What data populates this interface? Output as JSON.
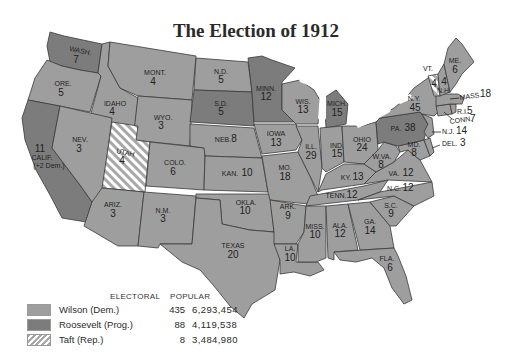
{
  "title": "The Election of 1912",
  "colors": {
    "wilson": "#9e9e9e",
    "roosevelt": "#7c7c7c",
    "taft_stripe": "#a8a8a8",
    "taft_bg": "#ffffff",
    "water": "#ffffff",
    "border": "#3a3a3a"
  },
  "legend": {
    "headers": {
      "electoral": "ELECTORAL",
      "popular": "POPULAR"
    },
    "rows": [
      {
        "candidate": "Wilson (Dem.)",
        "electoral": "435",
        "popular": "6,293,454",
        "pattern": "wilson"
      },
      {
        "candidate": "Roosevelt (Prog.)",
        "electoral": "88",
        "popular": "4,119,538",
        "pattern": "roosevelt"
      },
      {
        "candidate": "Taft (Rep.)",
        "electoral": "8",
        "popular": "3,484,980",
        "pattern": "taft"
      }
    ]
  },
  "states": [
    {
      "abbr": "WASH.",
      "votes": "7",
      "winner": "Roosevelt"
    },
    {
      "abbr": "ORE.",
      "votes": "5",
      "winner": "Wilson"
    },
    {
      "abbr": "CALIF.",
      "votes": "11",
      "note": "(+2 Dem.)",
      "winner": "Roosevelt"
    },
    {
      "abbr": "IDAHO",
      "votes": "4",
      "winner": "Wilson"
    },
    {
      "abbr": "NEV.",
      "votes": "3",
      "winner": "Wilson"
    },
    {
      "abbr": "MONT.",
      "votes": "4",
      "winner": "Wilson"
    },
    {
      "abbr": "WYO.",
      "votes": "3",
      "winner": "Wilson"
    },
    {
      "abbr": "UTAH",
      "votes": "4",
      "winner": "Taft"
    },
    {
      "abbr": "COLO.",
      "votes": "6",
      "winner": "Wilson"
    },
    {
      "abbr": "ARIZ.",
      "votes": "3",
      "winner": "Wilson"
    },
    {
      "abbr": "N.M.",
      "votes": "3",
      "winner": "Wilson"
    },
    {
      "abbr": "N.D.",
      "votes": "5",
      "winner": "Wilson"
    },
    {
      "abbr": "S.D.",
      "votes": "5",
      "winner": "Roosevelt"
    },
    {
      "abbr": "NEB.",
      "votes": "8",
      "winner": "Wilson"
    },
    {
      "abbr": "KAN.",
      "votes": "10",
      "winner": "Wilson"
    },
    {
      "abbr": "OKLA.",
      "votes": "10",
      "winner": "Wilson"
    },
    {
      "abbr": "TEXAS",
      "votes": "20",
      "winner": "Wilson"
    },
    {
      "abbr": "MINN.",
      "votes": "12",
      "winner": "Roosevelt"
    },
    {
      "abbr": "IOWA",
      "votes": "13",
      "winner": "Wilson"
    },
    {
      "abbr": "MO.",
      "votes": "18",
      "winner": "Wilson"
    },
    {
      "abbr": "ARK.",
      "votes": "9",
      "winner": "Wilson"
    },
    {
      "abbr": "LA.",
      "votes": "10",
      "winner": "Wilson"
    },
    {
      "abbr": "WIS.",
      "votes": "13",
      "winner": "Wilson"
    },
    {
      "abbr": "ILL.",
      "votes": "29",
      "winner": "Wilson"
    },
    {
      "abbr": "MICH.",
      "votes": "15",
      "winner": "Roosevelt"
    },
    {
      "abbr": "IND.",
      "votes": "15",
      "winner": "Wilson"
    },
    {
      "abbr": "OHIO",
      "votes": "24",
      "winner": "Wilson"
    },
    {
      "abbr": "KY.",
      "votes": "13",
      "winner": "Wilson"
    },
    {
      "abbr": "TENN.",
      "votes": "12",
      "winner": "Wilson"
    },
    {
      "abbr": "MISS.",
      "votes": "10",
      "winner": "Wilson"
    },
    {
      "abbr": "ALA.",
      "votes": "12",
      "winner": "Wilson"
    },
    {
      "abbr": "GA.",
      "votes": "14",
      "winner": "Wilson"
    },
    {
      "abbr": "FLA.",
      "votes": "6",
      "winner": "Wilson"
    },
    {
      "abbr": "S.C.",
      "votes": "9",
      "winner": "Wilson"
    },
    {
      "abbr": "N.C.",
      "votes": "12",
      "winner": "Wilson"
    },
    {
      "abbr": "VA.",
      "votes": "12",
      "winner": "Wilson"
    },
    {
      "abbr": "W.VA.",
      "votes": "8",
      "winner": "Wilson"
    },
    {
      "abbr": "MD.",
      "votes": "8",
      "winner": "Wilson"
    },
    {
      "abbr": "DEL.",
      "votes": "3",
      "winner": "Wilson"
    },
    {
      "abbr": "PA.",
      "votes": "38",
      "winner": "Roosevelt"
    },
    {
      "abbr": "N.J.",
      "votes": "14",
      "winner": "Wilson"
    },
    {
      "abbr": "N.Y.",
      "votes": "45",
      "winner": "Wilson"
    },
    {
      "abbr": "CONN.",
      "votes": "7",
      "winner": "Wilson"
    },
    {
      "abbr": "R.I.",
      "votes": "5",
      "winner": "Wilson"
    },
    {
      "abbr": "MASS.",
      "votes": "18",
      "winner": "Wilson"
    },
    {
      "abbr": "VT.",
      "votes": "4",
      "winner": "Taft"
    },
    {
      "abbr": "N.H.",
      "votes": "4",
      "winner": "Wilson"
    },
    {
      "abbr": "ME.",
      "votes": "6",
      "winner": "Wilson"
    }
  ]
}
